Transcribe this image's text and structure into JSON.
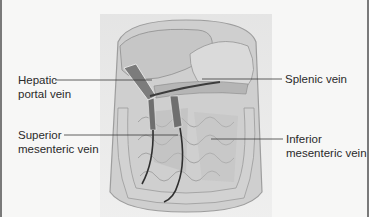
{
  "diagram": {
    "labels": [
      {
        "id": "hepatic-portal-vein",
        "line1": "Hepatic",
        "line2": "portal vein",
        "side": "left"
      },
      {
        "id": "splenic-vein",
        "line1": "Splenic vein",
        "line2": "",
        "side": "right"
      },
      {
        "id": "superior-mesenteric-vein",
        "line1": "Superior",
        "line2": "mesenteric vein",
        "side": "left"
      },
      {
        "id": "inferior-mesenteric-vein",
        "line1": "Inferior",
        "line2": "mesenteric vein",
        "side": "right"
      }
    ],
    "colors": {
      "background": "#f7f7f6",
      "label_text": "#2a2a2a",
      "leader_line": "#3a3a3a",
      "vein_dark": "#3c3c3c",
      "organ_gray": "#bdbdbd",
      "organ_light": "#dcdcdc"
    }
  }
}
